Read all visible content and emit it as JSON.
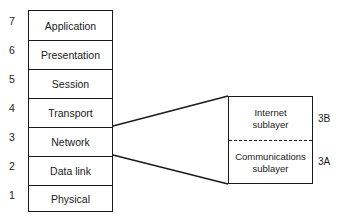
{
  "diagram": {
    "title": "",
    "osi_stack": {
      "layers": [
        {
          "number": "7",
          "label": "Application"
        },
        {
          "number": "6",
          "label": "Presentation"
        },
        {
          "number": "5",
          "label": "Session"
        },
        {
          "number": "4",
          "label": "Transport"
        },
        {
          "number": "3",
          "label": "Network"
        },
        {
          "number": "2",
          "label": "Data link"
        },
        {
          "number": "1",
          "label": "Physical"
        }
      ]
    },
    "network_expansion": {
      "expands_layer": "Network",
      "sublayers": [
        {
          "id": "3B",
          "label_line1": "Internet",
          "label_line2": "sublayer"
        },
        {
          "id": "3A",
          "label_line1": "Communications",
          "label_line2": "sublayer"
        }
      ],
      "divider_style": "dashed"
    },
    "colors": {
      "line": "#1a1a1a",
      "background": "#ffffff"
    }
  }
}
